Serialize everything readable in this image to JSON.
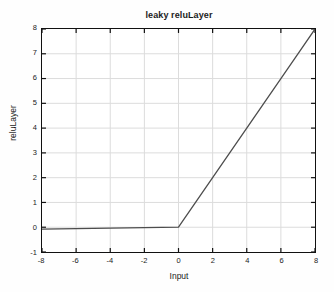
{
  "chart_data": {
    "type": "line",
    "title": "leaky reluLayer",
    "xlabel": "Input",
    "ylabel": "reluLayer",
    "xlim": [
      -8,
      8
    ],
    "ylim": [
      -1,
      8
    ],
    "xticks": [
      -8,
      -6,
      -4,
      -2,
      0,
      2,
      4,
      6,
      8
    ],
    "yticks": [
      -1,
      0,
      1,
      2,
      3,
      4,
      5,
      6,
      7,
      8
    ],
    "xtick_labels": [
      "-8",
      "-6",
      "-4",
      "-2",
      "0",
      "2",
      "4",
      "6",
      "8"
    ],
    "ytick_labels": [
      "-1",
      "0",
      "1",
      "2",
      "3",
      "4",
      "5",
      "6",
      "7",
      "8"
    ],
    "grid": true,
    "grid_color": "#dcdcdc",
    "legend": "none",
    "line_color": "#4d4d4d",
    "line_width": 1.3,
    "negative_slope": 0.01,
    "positive_slope": 1,
    "series": [
      {
        "name": "leaky relu",
        "x": [
          -8,
          -7,
          -6,
          -5,
          -4,
          -3,
          -2,
          -1,
          0,
          1,
          2,
          3,
          4,
          5,
          6,
          7,
          8
        ],
        "values": [
          -0.08,
          -0.07,
          -0.06,
          -0.05,
          -0.04,
          -0.03,
          -0.02,
          -0.01,
          0,
          1,
          2,
          3,
          4,
          5,
          6,
          7,
          8
        ]
      }
    ]
  },
  "figure": {
    "background": "#fefefe",
    "axes_color": "#111111",
    "plot_background": "#ffffff"
  }
}
